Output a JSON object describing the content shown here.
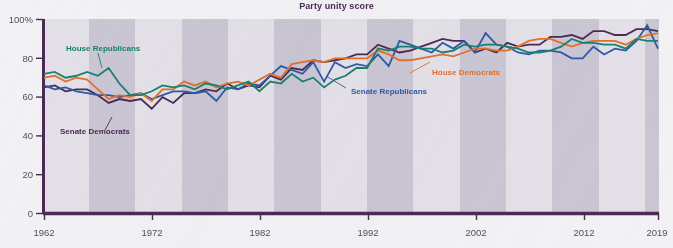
{
  "chart_data": {
    "type": "line",
    "title": "Party unity score",
    "xlabel": "",
    "ylabel": "",
    "xlim": [
      1962,
      2019
    ],
    "ylim": [
      0,
      100
    ],
    "grid": false,
    "legend_position": "inline-annotations",
    "y_ticks": [
      "0",
      "20",
      "40",
      "60",
      "80",
      "100%"
    ],
    "y_tick_values": [
      0,
      20,
      40,
      60,
      80,
      100
    ],
    "x_ticks": [
      "1962",
      "1972",
      "1982",
      "1992",
      "2002",
      "2012",
      "2019"
    ],
    "x_tick_values": [
      1962,
      1972,
      1982,
      1992,
      2002,
      2012,
      2019
    ],
    "x": [
      1962,
      1963,
      1964,
      1965,
      1966,
      1967,
      1968,
      1969,
      1970,
      1971,
      1972,
      1973,
      1974,
      1975,
      1976,
      1977,
      1978,
      1979,
      1980,
      1981,
      1982,
      1983,
      1984,
      1985,
      1986,
      1987,
      1988,
      1989,
      1990,
      1991,
      1992,
      1993,
      1994,
      1995,
      1996,
      1997,
      1998,
      1999,
      2000,
      2001,
      2002,
      2003,
      2004,
      2005,
      2006,
      2007,
      2008,
      2009,
      2010,
      2011,
      2012,
      2013,
      2014,
      2015,
      2016,
      2017,
      2018,
      2019
    ],
    "series": [
      {
        "name": "House Republicans",
        "color": "#18816f",
        "values": [
          72,
          73,
          70,
          71,
          73,
          71,
          75,
          67,
          61,
          61,
          63,
          66,
          65,
          66,
          64,
          67,
          66,
          64,
          66,
          68,
          63,
          68,
          67,
          72,
          68,
          70,
          65,
          69,
          71,
          75,
          75,
          85,
          84,
          86,
          86,
          85,
          85,
          83,
          84,
          87,
          86,
          87,
          87,
          86,
          85,
          83,
          83,
          84,
          86,
          90,
          88,
          88,
          87,
          87,
          85,
          90,
          89,
          89
        ]
      },
      {
        "name": "House Democrats",
        "color": "#e0712c",
        "values": [
          70,
          71,
          68,
          70,
          69,
          64,
          59,
          61,
          60,
          62,
          58,
          64,
          64,
          68,
          66,
          68,
          65,
          67,
          68,
          66,
          69,
          72,
          70,
          77,
          78,
          79,
          78,
          80,
          80,
          80,
          80,
          84,
          82,
          79,
          79,
          80,
          81,
          82,
          81,
          83,
          85,
          85,
          84,
          84,
          86,
          89,
          90,
          90,
          88,
          86,
          88,
          89,
          89,
          89,
          87,
          90,
          92,
          93
        ]
      },
      {
        "name": "Senate Republicans",
        "color": "#2e5aa8",
        "values": [
          66,
          64,
          65,
          63,
          62,
          61,
          61,
          60,
          61,
          62,
          59,
          61,
          63,
          63,
          62,
          63,
          58,
          65,
          64,
          67,
          66,
          71,
          76,
          74,
          72,
          78,
          68,
          78,
          75,
          77,
          76,
          82,
          76,
          89,
          87,
          85,
          83,
          88,
          85,
          89,
          83,
          93,
          87,
          86,
          83,
          82,
          84,
          84,
          83,
          80,
          80,
          86,
          82,
          85,
          84,
          89,
          97,
          85
        ]
      },
      {
        "name": "Senate Democrats",
        "color": "#4b2a53"
      }
    ],
    "annotations": [
      {
        "label": "House Republicans",
        "color": "#18816f"
      },
      {
        "label": "House Democrats",
        "color": "#e0712c"
      },
      {
        "label": "Senate Republicans",
        "color": "#2e5aa8"
      },
      {
        "label": "Senate Democrats",
        "color": "#4b2a53"
      }
    ],
    "colors": {
      "house_republicans": "#18816f",
      "house_democrats": "#e0712c",
      "senate_republicans": "#2e5aa8",
      "senate_democrats": "#4b2a53",
      "axis": "#4b2a53",
      "band_light": "#e2e0e6",
      "band_dark": "#cbc6d2",
      "background": "#f2f1f3"
    }
  }
}
